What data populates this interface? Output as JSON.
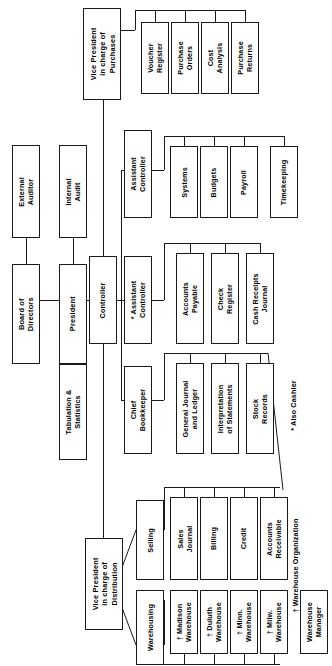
{
  "chart": {
    "orientation": "rotated-90",
    "nodes": {
      "board_of_directors": "Board of\nDirectors",
      "external_auditor": "External\nAuditor",
      "internal_audit": "Internal\nAudit",
      "president": "President",
      "tabulation_statistics": "Tabulation &\nStatistics",
      "vp_purchases": "Vice President\nin charge of\nPurchases",
      "voucher_register": "Voucher\nRegister",
      "purchase_orders": "Purchase\nOrders",
      "cost_analysis": "Cost\nAnalysis",
      "purchase_returns": "Purchase\nReturns",
      "controller": "Controller",
      "assistant_controller_1": "Assistant\nController",
      "systems": "Systems",
      "budgets": "Budgets",
      "payroll": "Payroll",
      "timekeeping": "Timekeeping",
      "assistant_controller_2": "* Assistant\nController",
      "accounts_payable": "Accounts\nPayable",
      "check_register": "Check\nRegister",
      "cash_receipts_journal": "Cash Receipts\nJournal",
      "chief_bookkeeper": "Chief\nBookkeeper",
      "general_journal_ledger": "General Journal\nand Ledger",
      "interpretation_statements": "Interpretation\nof Statements",
      "stock_records": "Stock\nRecords",
      "vp_distribution": "Vice President\nin charge of\nDistribution",
      "selling": "Selling",
      "sales_journal": "Sales\nJournal",
      "billing": "Billing",
      "credit": "Credit",
      "accounts_receivable": "Accounts\nReceivable",
      "warehousing": "Warehousing",
      "madison_warehouse": "† Madison\nWarehouse",
      "duluth_warehouse": "† Duluth\nWarehouse",
      "minn_warehouse": "† Minn.\nWarehouse",
      "milw_warehouse": "† Milw.\nWarehouse",
      "warehouse_manager": "Warehouse\nManager"
    },
    "footnotes": {
      "also_cashier": "* Also Cashier",
      "warehouse_organization": "† Warehouse Organization"
    }
  }
}
